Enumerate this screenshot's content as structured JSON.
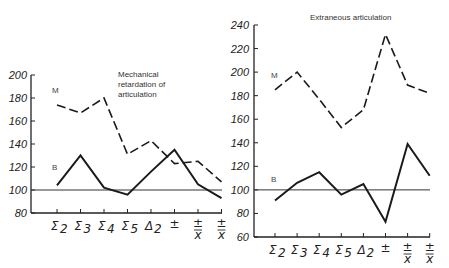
{
  "chart_data": [
    {
      "type": "line",
      "title": "Mechanical retardation of articulation",
      "title_lines": [
        "Mechanical",
        "retardation of",
        "articulation"
      ],
      "xlabel": "",
      "ylabel": "",
      "categories": [
        "Σ2",
        "Σ3",
        "Σ4",
        "Σ5",
        "Δ2",
        "±",
        "±/x",
        "±/x̄"
      ],
      "yticks": [
        80,
        100,
        120,
        140,
        160,
        180,
        200
      ],
      "ylim": [
        80,
        200
      ],
      "reference_line": 100,
      "grid": false,
      "series": [
        {
          "name": "M",
          "style": "dashed",
          "values": [
            174,
            167,
            180,
            131,
            143,
            123,
            125,
            107
          ]
        },
        {
          "name": "B",
          "style": "solid",
          "values": [
            104,
            130,
            102,
            96,
            116,
            135,
            105,
            93
          ]
        }
      ]
    },
    {
      "type": "line",
      "title": "Extraneous articulation",
      "title_lines": [
        "Extraneous articulation"
      ],
      "xlabel": "",
      "ylabel": "",
      "categories": [
        "Σ2",
        "Σ3",
        "Σ4",
        "Σ5",
        "Δ2",
        "±",
        "±/x",
        "±/x̄"
      ],
      "yticks": [
        60,
        80,
        100,
        120,
        140,
        160,
        180,
        200,
        220,
        240
      ],
      "ylim": [
        60,
        240
      ],
      "reference_line": 100,
      "grid": false,
      "series": [
        {
          "name": "M",
          "style": "dashed",
          "values": [
            185,
            200,
            177,
            153,
            168,
            232,
            189,
            182
          ]
        },
        {
          "name": "B",
          "style": "solid",
          "values": [
            91,
            106,
            115,
            96,
            105,
            73,
            139,
            112
          ]
        }
      ]
    }
  ],
  "left": {
    "title_lines": [
      "Mechanical",
      "retardation of",
      "articulation"
    ],
    "series_labels": {
      "m": "M",
      "b": "B"
    }
  },
  "right": {
    "title": "Extraneous articulation",
    "series_labels": {
      "m": "M",
      "b": "B"
    }
  }
}
